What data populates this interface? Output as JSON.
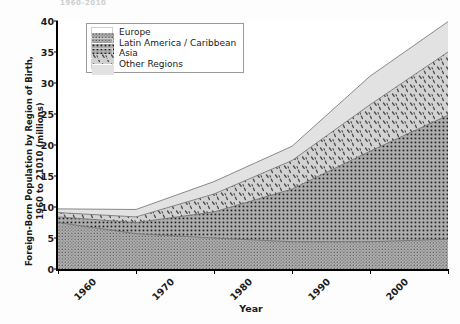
{
  "title_remnant": "1960-2010",
  "axis": {
    "ylabel": "Foreign-Born Population by Region of Birth,\n1960 to 21010 (millions)",
    "xlabel": "Year",
    "yticks": [
      "0",
      "5",
      "10",
      "15",
      "20",
      "25",
      "30",
      "35",
      "40"
    ],
    "xticks": [
      "1960",
      "1970",
      "1980",
      "1990",
      "2000",
      "2010"
    ]
  },
  "legend": {
    "items": [
      {
        "label": "Europe",
        "pattern": "dense-dots",
        "color": "#9e9e9e"
      },
      {
        "label": "Latin America / Caribbean",
        "pattern": "square-dots",
        "color": "#a8a8a8"
      },
      {
        "label": "Asia",
        "pattern": "sparse-dashes",
        "color": "#c8c8c8"
      },
      {
        "label": "Other Regions",
        "pattern": "light-solid",
        "color": "#dcdcdc"
      }
    ]
  },
  "chart_data": {
    "type": "area",
    "stacked": true,
    "xlabel": "Year",
    "ylabel": "Foreign-Born Population by Region of Birth, 1960 to 21010 (millions)",
    "x": [
      1960,
      1970,
      1980,
      1990,
      2000,
      2010
    ],
    "xlim": [
      1960,
      2010
    ],
    "ylim": [
      0,
      40
    ],
    "ytick_step": 5,
    "grid": false,
    "legend_position": "top-left",
    "series": [
      {
        "name": "Europe",
        "values": [
          7.5,
          5.7,
          5.0,
          4.4,
          4.4,
          4.8
        ]
      },
      {
        "name": "Latin America / Caribbean",
        "values": [
          0.9,
          1.8,
          4.2,
          8.5,
          14.6,
          20.0
        ]
      },
      {
        "name": "Asia",
        "values": [
          0.7,
          0.9,
          2.9,
          4.6,
          7.5,
          10.2
        ]
      },
      {
        "name": "Other Regions",
        "values": [
          0.6,
          1.2,
          2.0,
          2.3,
          4.6,
          4.9
        ]
      }
    ],
    "cumulative_tops": {
      "Europe": [
        7.5,
        5.7,
        5.0,
        4.4,
        4.4,
        4.8
      ],
      "Latin America / Caribbean": [
        8.4,
        7.5,
        9.2,
        12.9,
        19.0,
        24.8
      ],
      "Asia": [
        9.1,
        8.4,
        12.1,
        17.5,
        26.5,
        35.0
      ],
      "Other Regions": [
        9.7,
        9.6,
        14.1,
        19.8,
        31.1,
        39.9
      ]
    }
  }
}
